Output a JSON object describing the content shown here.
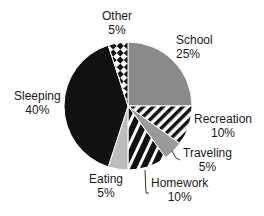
{
  "chart_data": {
    "type": "pie",
    "title": "",
    "categories": [
      "School",
      "Recreation",
      "Traveling",
      "Homework",
      "Eating",
      "Sleeping",
      "Other"
    ],
    "values": [
      25,
      10,
      5,
      10,
      5,
      40,
      5
    ],
    "value_labels": [
      "25%",
      "10%",
      "5%",
      "10%",
      "5%",
      "40%",
      "5%"
    ],
    "fills": [
      "solid gray #8a8a8a",
      "diagonal black/white stripes",
      "solid gray #9a9a9a",
      "diagonal black/white stripes (wide)",
      "solid light gray #bdbdbd",
      "solid black #111111",
      "black/white diamond checker"
    ],
    "start_angle": "12 o'clock",
    "direction": "clockwise",
    "legend": "none (direct labels)",
    "grid": false
  },
  "labels": {
    "school": {
      "name": "School",
      "pct": "25%"
    },
    "recreation": {
      "name": "Recreation",
      "pct": "10%"
    },
    "traveling": {
      "name": "Traveling",
      "pct": "5%"
    },
    "homework": {
      "name": "Homework",
      "pct": "10%"
    },
    "eating": {
      "name": "Eating",
      "pct": "5%"
    },
    "sleeping": {
      "name": "Sleeping",
      "pct": "40%"
    },
    "other": {
      "name": "Other",
      "pct": "5%"
    }
  }
}
